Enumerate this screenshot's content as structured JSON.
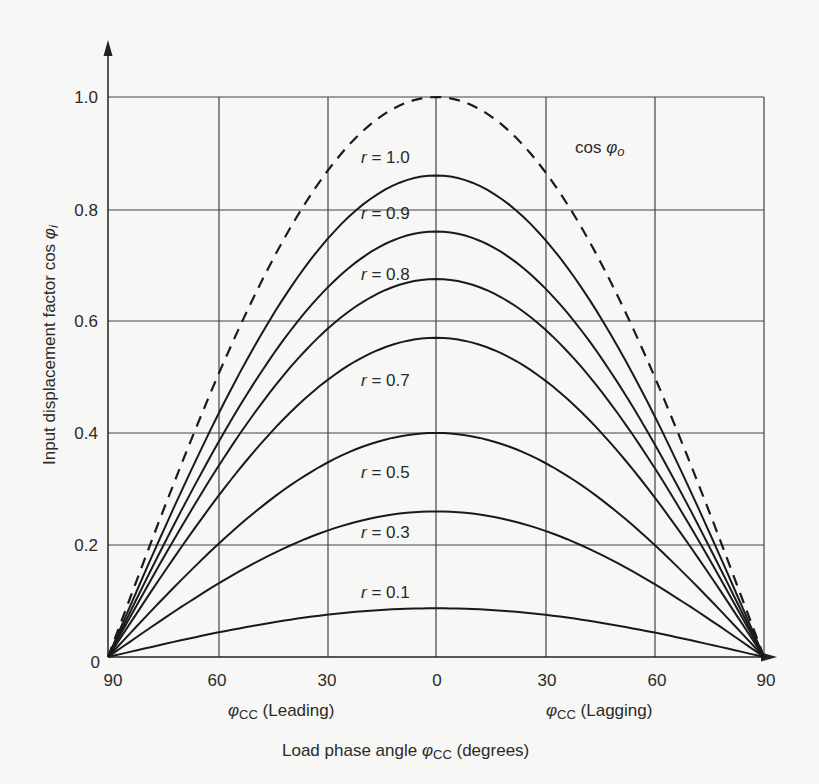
{
  "chart_data": {
    "type": "line",
    "title": "",
    "xlabel": "Load phase angle φCC (degrees)",
    "ylabel": "Input displacement factor cos φi",
    "x_sub_labels": {
      "leading": "φCC (Leading)",
      "lagging": "φCC (Lagging)"
    },
    "x": [
      -90,
      -75,
      -60,
      -45,
      -30,
      -15,
      0,
      15,
      30,
      45,
      60,
      75,
      90
    ],
    "x_tick_labels": [
      "90",
      "60",
      "30",
      "0",
      "30",
      "60",
      "90"
    ],
    "x_tick_positions": [
      -90,
      -60,
      -30,
      0,
      30,
      60,
      90
    ],
    "y_tick_labels": [
      "0",
      "0.2",
      "0.4",
      "0.6",
      "0.8",
      "1.0"
    ],
    "xlim": [
      -90,
      90
    ],
    "ylim": [
      0,
      1.0
    ],
    "grid": true,
    "legend": "inline labels",
    "series": [
      {
        "name": "cos φo",
        "style": "dashed",
        "peak": 1.0,
        "values": [
          0,
          0.259,
          0.5,
          0.707,
          0.866,
          0.966,
          1.0,
          0.966,
          0.866,
          0.707,
          0.5,
          0.259,
          0
        ]
      },
      {
        "name": "r = 1.0",
        "style": "solid",
        "peak": 0.86,
        "values": [
          0,
          0.223,
          0.43,
          0.608,
          0.745,
          0.831,
          0.86,
          0.831,
          0.745,
          0.608,
          0.43,
          0.223,
          0
        ]
      },
      {
        "name": "r = 0.9",
        "style": "solid",
        "peak": 0.76,
        "values": [
          0,
          0.197,
          0.38,
          0.537,
          0.658,
          0.734,
          0.76,
          0.734,
          0.658,
          0.537,
          0.38,
          0.197,
          0
        ]
      },
      {
        "name": "r = 0.8",
        "style": "solid",
        "peak": 0.675,
        "values": [
          0,
          0.175,
          0.338,
          0.477,
          0.585,
          0.652,
          0.675,
          0.652,
          0.585,
          0.477,
          0.338,
          0.175,
          0
        ]
      },
      {
        "name": "r = 0.7",
        "style": "solid",
        "peak": 0.57,
        "values": [
          0,
          0.148,
          0.285,
          0.403,
          0.494,
          0.551,
          0.57,
          0.551,
          0.494,
          0.403,
          0.285,
          0.148,
          0
        ]
      },
      {
        "name": "r = 0.5",
        "style": "solid",
        "peak": 0.4,
        "values": [
          0,
          0.104,
          0.2,
          0.283,
          0.346,
          0.386,
          0.4,
          0.386,
          0.346,
          0.283,
          0.2,
          0.104,
          0
        ]
      },
      {
        "name": "r = 0.3",
        "style": "solid",
        "peak": 0.26,
        "values": [
          0,
          0.067,
          0.13,
          0.184,
          0.225,
          0.251,
          0.26,
          0.251,
          0.225,
          0.184,
          0.13,
          0.067,
          0
        ]
      },
      {
        "name": "r = 0.1",
        "style": "solid",
        "peak": 0.087,
        "values": [
          0,
          0.023,
          0.044,
          0.062,
          0.075,
          0.084,
          0.087,
          0.084,
          0.075,
          0.062,
          0.044,
          0.023,
          0
        ]
      }
    ],
    "annotations": [
      {
        "text": "cos φo",
        "near": "dashed curve, upper right"
      },
      {
        "text": "r = 1.0"
      },
      {
        "text": "r = 0.9"
      },
      {
        "text": "r = 0.8"
      },
      {
        "text": "r = 0.7"
      },
      {
        "text": "r = 0.5"
      },
      {
        "text": "r = 0.3"
      },
      {
        "text": "r = 0.1"
      }
    ]
  },
  "labels": {
    "y_axis": "Input displacement factor cos ",
    "y_axis_sym": "φ",
    "y_axis_sub": "i",
    "x_axis_main": "Load phase angle ",
    "x_axis_sym": "φ",
    "x_axis_sub": "CC",
    "x_axis_tail": " (degrees)",
    "leading_sym": "φ",
    "leading_sub": "CC",
    "leading_text": " (Leading)",
    "lagging_sym": "φ",
    "lagging_sub": "CC",
    "lagging_text": " (Lagging)",
    "cos_o_text": "cos ",
    "cos_o_sym": "φ",
    "cos_o_sub": "o",
    "r_labels": [
      "r",
      "r",
      "r",
      "r",
      "r",
      "r",
      "r"
    ],
    "r_values": [
      "= 1.0",
      "= 0.9",
      "= 0.8",
      "= 0.7",
      "= 0.5",
      "= 0.3",
      "= 0.1"
    ],
    "y_ticks": [
      "1.0",
      "0.8",
      "0.6",
      "0.4",
      "0.2",
      "0"
    ],
    "x_ticks": [
      "90",
      "60",
      "30",
      "0",
      "30",
      "60",
      "90"
    ]
  }
}
